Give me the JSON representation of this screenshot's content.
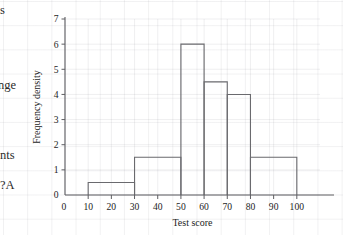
{
  "page": {
    "background_color": "#ffffff",
    "margin_text_fragments": [
      {
        "text": "s"
      },
      {
        "text": "nge"
      },
      {
        "text": "nts"
      },
      {
        "text": "A?"
      }
    ]
  },
  "chart_data": {
    "type": "bar",
    "title": "",
    "subtitle": "",
    "xlabel": "Test score",
    "ylabel": "Frequency density",
    "xlim": [
      0,
      110
    ],
    "ylim": [
      0,
      7
    ],
    "grid": true,
    "legend": null,
    "legend_position": "none",
    "xticks": [
      0,
      10,
      20,
      30,
      40,
      50,
      60,
      70,
      80,
      90,
      100
    ],
    "xtick_labels": [
      "0",
      "10",
      "20",
      "30",
      "40",
      "50",
      "60",
      "70",
      "80",
      "90",
      "100"
    ],
    "yticks": [
      0,
      1,
      2,
      3,
      4,
      5,
      6,
      7
    ],
    "ytick_labels": [
      "0",
      "1",
      "2",
      "3",
      "4",
      "5",
      "6",
      "7"
    ],
    "bar_edge_color": "#6a6a6e",
    "bar_fill_color": "none",
    "axis_color": "#5e5e62",
    "bins": [
      {
        "label": "10-30",
        "x_start": 10,
        "x_end": 30,
        "value": 0.5
      },
      {
        "label": "30-50",
        "x_start": 30,
        "x_end": 50,
        "value": 1.5
      },
      {
        "label": "50-60",
        "x_start": 50,
        "x_end": 60,
        "value": 6.0
      },
      {
        "label": "60-70",
        "x_start": 60,
        "x_end": 70,
        "value": 4.5
      },
      {
        "label": "70-80",
        "x_start": 70,
        "x_end": 80,
        "value": 4.0
      },
      {
        "label": "80-100",
        "x_start": 80,
        "x_end": 100,
        "value": 1.5
      }
    ],
    "categories": [
      "10-30",
      "30-50",
      "50-60",
      "60-70",
      "70-80",
      "80-100"
    ],
    "values": [
      0.5,
      1.5,
      6.0,
      4.5,
      4.0,
      1.5
    ]
  }
}
